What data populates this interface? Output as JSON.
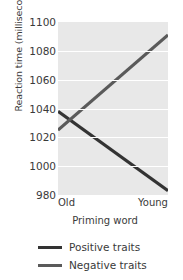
{
  "chart_data": {
    "type": "line",
    "title": "",
    "xlabel": "Priming word",
    "ylabel": "Reaction time (milliseconds)",
    "categories": [
      "Old",
      "Young"
    ],
    "x": [
      0,
      1
    ],
    "ylim": [
      980,
      1100
    ],
    "yticks": [
      1100,
      1080,
      1060,
      1040,
      1020,
      1000,
      980
    ],
    "ytick_labels": [
      "1100",
      "1080",
      "1060",
      "1040",
      "1020",
      "1000",
      "980"
    ],
    "grid": true,
    "grid_axis": "y",
    "legend_position": "below",
    "series": [
      {
        "name": "Positive traits",
        "values": [
          1038,
          983
        ],
        "color": "#333333",
        "linewidth": 3.2
      },
      {
        "name": "Negative traits",
        "values": [
          1025,
          1091
        ],
        "color": "#5a5a5a",
        "linewidth": 3.2
      }
    ]
  },
  "legend": {
    "items": [
      {
        "label": "Positive traits",
        "color": "#333333"
      },
      {
        "label": "Negative traits",
        "color": "#5a5a5a"
      }
    ]
  },
  "axes": {
    "x_tick_left": "Old",
    "x_tick_right": "Young",
    "x_title": "Priming word",
    "y_title": "Reaction time (milliseconds)"
  },
  "colors": {
    "plot_background": "#e8e8e8",
    "gridline": "#ffffff",
    "page_background": "#ffffff",
    "text": "#3a3a3a"
  }
}
